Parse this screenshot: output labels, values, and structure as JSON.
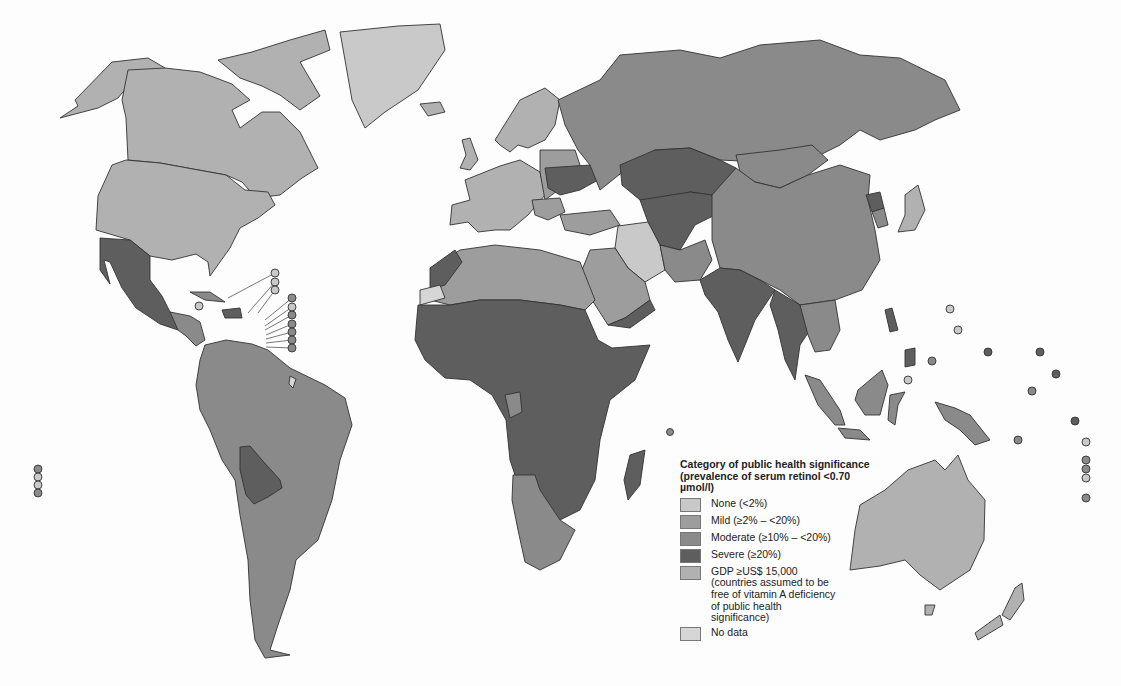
{
  "map": {
    "type": "choropleth-world",
    "subject": "Vitamin A deficiency (serum retinol) public health significance by country",
    "colors": {
      "none": "#c9c9c9",
      "mild": "#9d9d9d",
      "moderate": "#8a8a8a",
      "severe": "#5e5e5e",
      "gdp": "#b1b1b1",
      "no_data": "#d6d6d6"
    }
  },
  "legend": {
    "title": "Category of public health significance (prevalence of serum retinol <0.70 µmol/l)",
    "items": [
      {
        "key": "none",
        "label": "None (<2%)"
      },
      {
        "key": "mild",
        "label": "Mild (≥2% – <20%)"
      },
      {
        "key": "moderate",
        "label": "Moderate (≥10% – <20%)"
      },
      {
        "key": "severe",
        "label": "Severe (≥20%)"
      },
      {
        "key": "gdp",
        "label": "GDP ≥US$ 15,000 (countries assumed to be free of vitamin A deficiency of public health significance)"
      },
      {
        "key": "no_data",
        "label": "No data"
      }
    ]
  }
}
